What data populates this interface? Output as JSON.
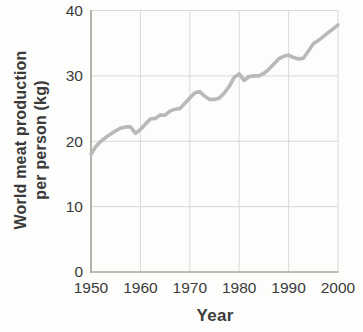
{
  "figure": {
    "xlabel": "Year",
    "ylabel_line1": "World meat production",
    "ylabel_line2": "per person (kg)"
  },
  "chart_data": {
    "type": "line",
    "title": "",
    "xlabel": "Year",
    "ylabel": "World meat production per person (kg)",
    "series_name": "world-meat-production-per-person",
    "x": [
      1950,
      1951,
      1952,
      1953,
      1954,
      1955,
      1956,
      1957,
      1958,
      1959,
      1960,
      1961,
      1962,
      1963,
      1964,
      1965,
      1966,
      1967,
      1968,
      1969,
      1970,
      1971,
      1972,
      1973,
      1974,
      1975,
      1976,
      1977,
      1978,
      1979,
      1980,
      1981,
      1982,
      1983,
      1984,
      1985,
      1986,
      1987,
      1988,
      1989,
      1990,
      1991,
      1992,
      1993,
      1994,
      1995,
      1996,
      1997,
      1998,
      1999,
      2000
    ],
    "values": [
      18.0,
      19.2,
      20.0,
      20.6,
      21.1,
      21.6,
      22.0,
      22.2,
      22.2,
      21.2,
      21.8,
      22.6,
      23.4,
      23.5,
      24.0,
      24.0,
      24.6,
      24.9,
      25.0,
      25.8,
      26.6,
      27.4,
      27.6,
      26.9,
      26.4,
      26.4,
      26.6,
      27.4,
      28.4,
      29.8,
      30.3,
      29.3,
      29.9,
      30.0,
      30.0,
      30.4,
      31.0,
      31.8,
      32.6,
      33.0,
      33.2,
      32.8,
      32.6,
      32.7,
      33.8,
      34.9,
      35.4,
      36.0,
      36.6,
      37.2,
      37.8
    ],
    "xlim": [
      1950,
      2000
    ],
    "ylim": [
      0,
      40
    ],
    "xticks": [
      1950,
      1960,
      1970,
      1980,
      1990,
      2000
    ],
    "yticks": [
      0,
      10,
      20,
      30,
      40
    ],
    "grid": true,
    "legend": "none",
    "line_color": "#b9b9b9",
    "grid_color": "#d9d9d9",
    "axis_color": "#aaa59f",
    "text_color": "#3b3b3b"
  }
}
